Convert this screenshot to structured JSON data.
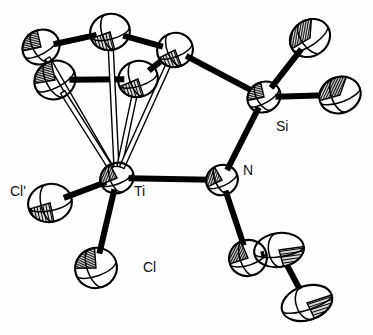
{
  "figure": {
    "kind": "ortep-thermal-ellipsoid-plot",
    "caption": "",
    "background_color": "#fefefe",
    "stroke_color": "#000000",
    "fill_color": "#ffffff",
    "hatch_color": "#000000",
    "width": 373,
    "height": 335
  },
  "labels": [
    {
      "id": "label-si",
      "text": "Si",
      "x": 276,
      "y": 131
    },
    {
      "id": "label-n",
      "text": "N",
      "x": 243,
      "y": 175
    },
    {
      "id": "label-ti",
      "text": "Ti",
      "x": 134,
      "y": 196
    },
    {
      "id": "label-cl-prime",
      "text": "Cl'",
      "x": 10,
      "y": 196
    },
    {
      "id": "label-cl",
      "text": "Cl",
      "x": 143,
      "y": 272
    }
  ],
  "atoms": [
    {
      "id": "Ti",
      "element": "Ti",
      "label": "Ti",
      "x": 117,
      "y": 178,
      "rx": 17,
      "ry": 15,
      "rot": -22,
      "octant": "left",
      "labelled": true
    },
    {
      "id": "Si",
      "element": "Si",
      "label": "Si",
      "x": 264,
      "y": 97,
      "rx": 17,
      "ry": 15,
      "rot": -30,
      "octant": "upper",
      "labelled": true
    },
    {
      "id": "N",
      "element": "N",
      "label": "N",
      "x": 222,
      "y": 180,
      "rx": 16,
      "ry": 15,
      "rot": -25,
      "octant": "left",
      "labelled": true
    },
    {
      "id": "Cl",
      "element": "Cl",
      "label": "Cl",
      "x": 96,
      "y": 268,
      "rx": 21,
      "ry": 20,
      "rot": -20,
      "octant": "upper",
      "labelled": true
    },
    {
      "id": "Cl1",
      "element": "Cl",
      "label": "Cl'",
      "x": 50,
      "y": 203,
      "rx": 22,
      "ry": 19,
      "rot": -12,
      "octant": "lower",
      "labelled": true
    },
    {
      "id": "C1",
      "element": "C",
      "label": "",
      "x": 110,
      "y": 32,
      "rx": 20,
      "ry": 18,
      "rot": -15,
      "octant": "lower",
      "labelled": false
    },
    {
      "id": "C2",
      "element": "C",
      "label": "",
      "x": 41,
      "y": 47,
      "rx": 19,
      "ry": 17,
      "rot": -30,
      "octant": "upper",
      "labelled": false
    },
    {
      "id": "C3",
      "element": "C",
      "label": "",
      "x": 55,
      "y": 80,
      "rx": 21,
      "ry": 19,
      "rot": -28,
      "octant": "upper",
      "labelled": false
    },
    {
      "id": "C4",
      "element": "C",
      "label": "",
      "x": 138,
      "y": 79,
      "rx": 20,
      "ry": 18,
      "rot": -18,
      "octant": "lower",
      "labelled": false
    },
    {
      "id": "C5",
      "element": "C",
      "label": "",
      "x": 175,
      "y": 50,
      "rx": 18,
      "ry": 17,
      "rot": -22,
      "octant": "lower",
      "labelled": false
    },
    {
      "id": "C6",
      "element": "C",
      "label": "",
      "x": 310,
      "y": 38,
      "rx": 21,
      "ry": 18,
      "rot": -35,
      "octant": "full",
      "labelled": false
    },
    {
      "id": "C7",
      "element": "C",
      "label": "",
      "x": 340,
      "y": 95,
      "rx": 21,
      "ry": 18,
      "rot": -20,
      "octant": "full",
      "labelled": false
    },
    {
      "id": "C8",
      "element": "C",
      "label": "",
      "x": 248,
      "y": 258,
      "rx": 19,
      "ry": 18,
      "rot": -18,
      "octant": "left",
      "labelled": false
    },
    {
      "id": "C9",
      "element": "C",
      "label": "",
      "x": 279,
      "y": 250,
      "rx": 25,
      "ry": 17,
      "rot": -8,
      "octant": "right",
      "labelled": false
    },
    {
      "id": "C10",
      "element": "C",
      "label": "",
      "x": 307,
      "y": 303,
      "rx": 26,
      "ry": 17,
      "rot": -18,
      "octant": "right",
      "labelled": false
    }
  ],
  "bonds": [
    {
      "from": "Ti",
      "to": "Cl",
      "style": "solid",
      "width": 6
    },
    {
      "from": "Ti",
      "to": "Cl1",
      "style": "solid",
      "width": 6
    },
    {
      "from": "Ti",
      "to": "N",
      "style": "solid",
      "width": 6
    },
    {
      "from": "N",
      "to": "Si",
      "style": "solid",
      "width": 6
    },
    {
      "from": "N",
      "to": "C8",
      "style": "solid",
      "width": 6
    },
    {
      "from": "Si",
      "to": "C5",
      "style": "solid",
      "width": 6
    },
    {
      "from": "Si",
      "to": "C6",
      "style": "solid",
      "width": 6
    },
    {
      "from": "Si",
      "to": "C7",
      "style": "solid",
      "width": 6
    },
    {
      "from": "C1",
      "to": "C2",
      "style": "solid",
      "width": 6
    },
    {
      "from": "C1",
      "to": "C5",
      "style": "solid",
      "width": 6
    },
    {
      "from": "C2",
      "to": "C3",
      "style": "solid",
      "width": 6
    },
    {
      "from": "C3",
      "to": "C4",
      "style": "solid",
      "width": 6
    },
    {
      "from": "C4",
      "to": "C5",
      "style": "solid",
      "width": 6
    },
    {
      "from": "C9",
      "to": "C10",
      "style": "solid",
      "width": 6
    },
    {
      "from": "C8",
      "to": "C9",
      "style": "solid",
      "width": 6
    },
    {
      "from": "Ti",
      "to": "C1",
      "style": "open",
      "width": 5
    },
    {
      "from": "Ti",
      "to": "C2",
      "style": "open",
      "width": 5
    },
    {
      "from": "Ti",
      "to": "C3",
      "style": "open",
      "width": 5
    },
    {
      "from": "Ti",
      "to": "C4",
      "style": "open",
      "width": 5
    },
    {
      "from": "Ti",
      "to": "C5",
      "style": "open",
      "width": 5
    }
  ]
}
